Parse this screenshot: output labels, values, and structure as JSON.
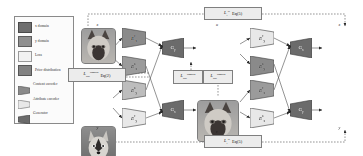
{
  "figure": {
    "type": "diagram"
  },
  "legend": {
    "items": [
      {
        "label": "x domain",
        "icon": "square-swatch",
        "shape": "square",
        "color": "#6e6e6e"
      },
      {
        "label": "y domain",
        "icon": "square-swatch",
        "shape": "square",
        "color": "#8f8f8f"
      },
      {
        "label": "Loss",
        "icon": "square-swatch",
        "shape": "square",
        "color": "#f2f2f2"
      },
      {
        "label": "Prior distribution",
        "icon": "square-swatch",
        "shape": "square",
        "color": "#828282"
      },
      {
        "label": "Content encoder",
        "icon": "trapezoid-right-narrow",
        "shape": "trapezoid",
        "color": "#8a8a8a"
      },
      {
        "label": "Attribute encoder",
        "icon": "trapezoid-right-narrow",
        "shape": "trapezoid",
        "color": "#e8e8e8"
      },
      {
        "label": "Generator",
        "icon": "trapezoid-right-wide",
        "shape": "trapezoid",
        "color": "#6b6b6b"
      }
    ]
  },
  "images": {
    "input_x": {
      "label": "x",
      "domain": "x",
      "subject": "cat"
    },
    "input_y": {
      "label": "y",
      "domain": "y",
      "subject": "husky"
    },
    "trans_u": {
      "label": "u",
      "domain": "y",
      "subject": "cat"
    },
    "trans_v": {
      "label": "v",
      "domain": "x",
      "subject": "husky"
    },
    "recon_x": {
      "label": "x",
      "domain": "x",
      "subject": "cat"
    },
    "recon_y": {
      "label": "y",
      "domain": "y",
      "subject": "husky"
    }
  },
  "encoders": {
    "enc_x_content_l": {
      "base": "E",
      "sup": "c",
      "sub": "x",
      "kind": "content"
    },
    "enc_x_attribute_l": {
      "base": "E",
      "sup": "a",
      "sub": "x",
      "kind": "attribute"
    },
    "enc_y_content_l": {
      "base": "E",
      "sup": "c",
      "sub": "y",
      "kind": "content"
    },
    "enc_y_attribute_l": {
      "base": "E",
      "sup": "a",
      "sub": "y",
      "kind": "attribute"
    },
    "enc_y_content_r": {
      "base": "E",
      "sup": "c",
      "sub": "y",
      "kind": "content"
    },
    "enc_y_attribute_r": {
      "base": "E",
      "sup": "a",
      "sub": "y",
      "kind": "attribute"
    },
    "enc_x_content_r": {
      "base": "E",
      "sup": "c",
      "sub": "x",
      "kind": "content"
    },
    "enc_x_attribute_r": {
      "base": "E",
      "sup": "a",
      "sub": "x",
      "kind": "attribute"
    }
  },
  "generators": {
    "gen_y_l": {
      "base": "G",
      "sub": "y"
    },
    "gen_x_l": {
      "base": "G",
      "sub": "x"
    },
    "gen_x_r": {
      "base": "G",
      "sub": "x"
    },
    "gen_y_r": {
      "base": "G",
      "sub": "y"
    }
  },
  "losses": {
    "cc_top": {
      "symbol": "L",
      "sup": "cc",
      "sub": "1",
      "equation": "Eq(5)"
    },
    "cc_bottom": {
      "symbol": "L",
      "sup": "cc",
      "sub": "1",
      "equation": "Eq(5)"
    },
    "adv_left": {
      "symbol": "L",
      "sup": "domain",
      "sub": "adv",
      "equation": "Eq(2)"
    },
    "adv_mid_a": {
      "symbol": "L",
      "sup": "domain",
      "sub": "adv",
      "equation": ""
    },
    "adv_mid_b": {
      "symbol": "L",
      "sup": "domain",
      "sub": "adv",
      "equation": ""
    }
  },
  "colors": {
    "content_encoder": "#8a8a8a",
    "attribute_encoder": "#e8e8e8",
    "generator": "#6b6b6b",
    "loss_box": "#ececec",
    "stroke": "#3d3d3d",
    "background": "#ffffff"
  }
}
